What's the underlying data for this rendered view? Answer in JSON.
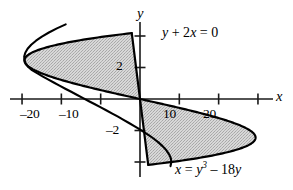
{
  "figure": {
    "axis_x_name": "x",
    "axis_y_name": "y",
    "equation_line": "y + 2x = 0",
    "equation_curve_lhs": "x = y",
    "equation_curve_exp": "3",
    "equation_curve_rhs": " – 18y"
  },
  "ticks": {
    "x_neg20": "–20",
    "x_neg10": "–10",
    "x_10": "10",
    "x_20": "20",
    "y_2": "2",
    "y_neg2": "–2"
  },
  "colors": {
    "background": "#ffffff",
    "ink": "#000000",
    "fill": "#c9c9c9",
    "axis": "#1a1a1a"
  },
  "chart_data": {
    "type": "line",
    "title": "",
    "xlabel": "x",
    "ylabel": "y",
    "xlim": [
      -33,
      34.5
    ],
    "ylim": [
      -5.8,
      4.7
    ],
    "grid": false,
    "legend": "none",
    "xticks": [
      -20,
      -10,
      10,
      20
    ],
    "xticklabels": [
      "–20",
      "–10",
      "10",
      "20"
    ],
    "yticks": [
      -4,
      -2,
      2,
      4
    ],
    "yticklabels": [
      "",
      "–2",
      "2",
      ""
    ],
    "annotations": [
      {
        "text": "y + 2x = 0",
        "x": 5.5,
        "y": 4.0
      },
      {
        "text": "x = y^3 – 18y",
        "x": 9.0,
        "y": -4.3
      }
    ],
    "series": [
      {
        "name": "x = y^3 - 18y",
        "type": "parametric_in_y",
        "equation": "x = y**3 - 18*y",
        "y": [
          -4.183,
          -4.0,
          -3.75,
          -3.5,
          -3.25,
          -3.0,
          -2.75,
          -2.449,
          -2.25,
          -2.0,
          -1.75,
          -1.5,
          -1.25,
          -1.0,
          -0.75,
          -0.5,
          -0.25,
          0.0,
          0.25,
          0.5,
          0.75,
          1.0,
          1.25,
          1.5,
          1.75,
          2.0,
          2.25,
          2.449,
          2.75,
          3.0,
          3.25,
          3.5,
          3.75,
          4.0,
          4.183
        ],
        "x": [
          2.09,
          8.0,
          14.77,
          20.12,
          24.2,
          27.0,
          28.7,
          29.39,
          29.11,
          28.0,
          26.14,
          23.63,
          20.55,
          17.0,
          13.08,
          8.88,
          4.48,
          0.0,
          -4.48,
          -8.88,
          -13.08,
          -17.0,
          -20.55,
          -23.63,
          -26.14,
          -28.0,
          -29.11,
          -29.39,
          -28.7,
          -27.0,
          -24.2,
          -20.12,
          -14.77,
          -8.0,
          -2.09
        ]
      },
      {
        "name": "y + 2x = 0",
        "type": "line",
        "equation": "x = -y/2",
        "y": [
          -4.183,
          0.0,
          4.183
        ],
        "x": [
          2.09,
          0.0,
          -2.09
        ]
      }
    ],
    "shaded_regions": [
      {
        "name": "upper-left-lobe",
        "between": [
          "x = y^3 - 18y",
          "x = -y/2"
        ],
        "y_range": [
          0.0,
          4.183
        ],
        "fill": "#c9c9c9"
      },
      {
        "name": "lower-right-lobe",
        "between": [
          "x = y^3 - 18y",
          "x = -y/2"
        ],
        "y_range": [
          -4.183,
          0.0
        ],
        "fill": "#c9c9c9"
      }
    ],
    "intersections": [
      {
        "x": 0.0,
        "y": 0.0
      },
      {
        "x": -2.09,
        "y": 4.183
      },
      {
        "x": 2.09,
        "y": -4.183
      }
    ]
  }
}
